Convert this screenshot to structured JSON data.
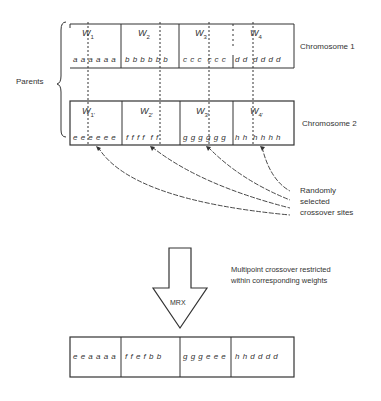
{
  "labels": {
    "parents": "Parents",
    "chromosome1": "Chromosome 1",
    "chromosome2": "Chromosome 2",
    "crossover_sites": [
      "Randomly",
      "selected",
      "crossover sites"
    ],
    "operator": "MRX",
    "description": [
      "Multipoint crossover restricted",
      "within corresponding weights"
    ]
  },
  "chromosome1": {
    "weights": [
      {
        "name": "W",
        "sub": "1",
        "genes": "a a a a a a"
      },
      {
        "name": "W",
        "sub": "2",
        "genes": "b b b b b b"
      },
      {
        "name": "W",
        "sub": "3",
        "genes": "c c c  c c c"
      },
      {
        "name": "W",
        "sub": "4",
        "genes": "d d  d d d d"
      }
    ]
  },
  "chromosome2": {
    "weights": [
      {
        "name": "W",
        "sub": "1'",
        "genes": "e e e e e e"
      },
      {
        "name": "W",
        "sub": "2'",
        "genes": "f f f f  f f"
      },
      {
        "name": "W",
        "sub": "3'",
        "genes": "g g g g g g"
      },
      {
        "name": "W",
        "sub": "4'",
        "genes": "h h  h h h h"
      }
    ]
  },
  "offspring": {
    "segments": [
      "e e a a a a",
      "f f e f  b b",
      "g g g e e e",
      "h h  d d d d"
    ]
  }
}
